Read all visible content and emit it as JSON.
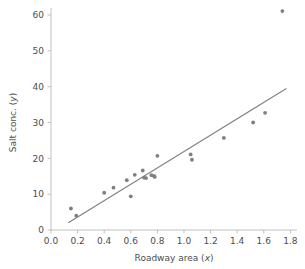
{
  "chart_data": {
    "type": "scatter",
    "title": "",
    "xlabel": "Roadway area (x)",
    "ylabel": "Salt conc. (y)",
    "xlim": [
      0.0,
      1.85
    ],
    "ylim": [
      0,
      62
    ],
    "grid": false,
    "legend": null,
    "xticks": [
      "0.0",
      "0.2",
      "0.4",
      "0.6",
      "0.8",
      "1.0",
      "1.2",
      "1.4",
      "1.6",
      "1.8"
    ],
    "xtick_values": [
      0.0,
      0.2,
      0.4,
      0.6,
      0.8,
      1.0,
      1.2,
      1.4,
      1.6,
      1.8
    ],
    "yticks": [
      "0",
      "10",
      "20",
      "30",
      "40",
      "50",
      "60"
    ],
    "ytick_values": [
      0,
      10,
      20,
      30,
      40,
      50,
      60
    ],
    "marker_color": "#7f7f7f",
    "line_color": "#7f7f7f",
    "axis_color": "#b0b0b0",
    "points": [
      {
        "x": 0.15,
        "y": 6.0
      },
      {
        "x": 0.19,
        "y": 4.0
      },
      {
        "x": 0.4,
        "y": 10.4
      },
      {
        "x": 0.47,
        "y": 11.8
      },
      {
        "x": 0.57,
        "y": 13.9
      },
      {
        "x": 0.6,
        "y": 9.4
      },
      {
        "x": 0.63,
        "y": 15.4
      },
      {
        "x": 0.69,
        "y": 16.6
      },
      {
        "x": 0.7,
        "y": 14.6
      },
      {
        "x": 0.715,
        "y": 14.5
      },
      {
        "x": 0.755,
        "y": 15.3
      },
      {
        "x": 0.775,
        "y": 15.1
      },
      {
        "x": 0.78,
        "y": 14.8
      },
      {
        "x": 0.8,
        "y": 20.7
      },
      {
        "x": 1.05,
        "y": 21.1
      },
      {
        "x": 1.06,
        "y": 19.6
      },
      {
        "x": 1.3,
        "y": 25.7
      },
      {
        "x": 1.52,
        "y": 30.0
      },
      {
        "x": 1.61,
        "y": 32.7
      },
      {
        "x": 1.74,
        "y": 61.1
      }
    ],
    "fit_line": {
      "type": "linear",
      "x_start": 0.13,
      "y_start": 2.0,
      "x_end": 1.77,
      "y_end": 39.5
    }
  }
}
